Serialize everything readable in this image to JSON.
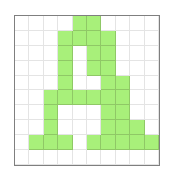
{
  "grid": {
    "cols": 10,
    "rows": 10,
    "fill_color": "#a8f07a",
    "empty_color": "#ffffff",
    "filled": [
      [
        0,
        0,
        0,
        0,
        1,
        1,
        0,
        0,
        0,
        0
      ],
      [
        0,
        0,
        0,
        1,
        1,
        1,
        1,
        0,
        0,
        0
      ],
      [
        0,
        0,
        0,
        1,
        0,
        1,
        1,
        0,
        0,
        0
      ],
      [
        0,
        0,
        0,
        1,
        0,
        1,
        1,
        0,
        0,
        0
      ],
      [
        0,
        0,
        0,
        1,
        0,
        0,
        1,
        1,
        0,
        0
      ],
      [
        0,
        0,
        1,
        1,
        1,
        1,
        1,
        1,
        0,
        0
      ],
      [
        0,
        0,
        1,
        0,
        0,
        0,
        1,
        1,
        0,
        0
      ],
      [
        0,
        0,
        1,
        0,
        0,
        0,
        1,
        1,
        1,
        0
      ],
      [
        0,
        1,
        1,
        1,
        0,
        1,
        1,
        1,
        1,
        1
      ],
      [
        0,
        0,
        0,
        0,
        0,
        0,
        0,
        0,
        0,
        0
      ]
    ]
  }
}
